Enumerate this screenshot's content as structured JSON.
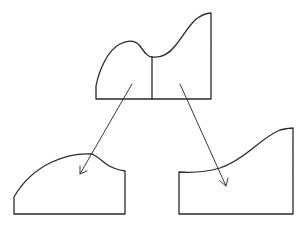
{
  "diagram": {
    "colors": {
      "stroke": "#2a2a2a",
      "background": "#ffffff"
    },
    "shapes": [
      {
        "name": "original-region",
        "parts": 2
      },
      {
        "name": "left-part"
      },
      {
        "name": "right-part"
      }
    ],
    "arrows": [
      {
        "from": "original-region-left",
        "to": "left-part"
      },
      {
        "from": "original-region-right",
        "to": "right-part"
      }
    ]
  }
}
